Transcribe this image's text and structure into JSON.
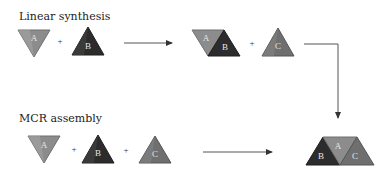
{
  "diagram": {
    "rows": [
      {
        "title": "Linear synthesis",
        "reactants": [
          "A",
          "B"
        ],
        "intermediate": [
          "A",
          "B"
        ],
        "extra_reactant": "C",
        "operator": "+"
      },
      {
        "title": "MCR assembly",
        "reactants": [
          "A",
          "B",
          "C"
        ],
        "operator": "+"
      }
    ],
    "product": [
      "B",
      "A",
      "C"
    ],
    "colors": {
      "A": "#8a8a8a",
      "B": "#2e2e2e",
      "C": "#707070",
      "arrow": "#555555"
    }
  },
  "labels": {
    "linear": "Linear synthesis",
    "mcr": "MCR assembly",
    "plus": "+",
    "A": "A",
    "B": "B",
    "C": "C"
  }
}
